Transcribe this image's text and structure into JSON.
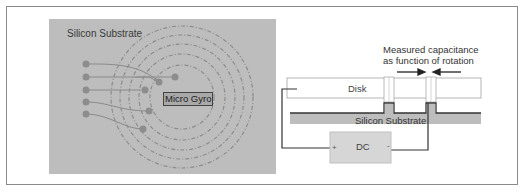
{
  "left_diagram": {
    "title": "Silicon Substrate",
    "center_label": "Micro Gyro",
    "background_color": "#bdbdbd",
    "ring_count": 5,
    "electrode_count": 5
  },
  "right_diagram": {
    "caption_line1": "Measured capacitance",
    "caption_line2": "as function of rotation",
    "disk_label": "Disk",
    "substrate_label": "Silicon Substrate",
    "source_label": "DC",
    "plus_terminal": "+",
    "minus_terminal": "-"
  }
}
